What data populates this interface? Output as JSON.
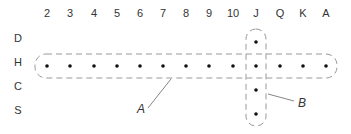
{
  "diagram": {
    "columns": [
      "2",
      "3",
      "4",
      "5",
      "6",
      "7",
      "8",
      "9",
      "10",
      "J",
      "Q",
      "K",
      "A"
    ],
    "rows": [
      "D",
      "H",
      "C",
      "S"
    ],
    "groups": [
      {
        "id": "A",
        "label": "A",
        "description": "Row H, all 13 columns"
      },
      {
        "id": "B",
        "label": "B",
        "description": "Column J, all 4 rows"
      }
    ],
    "dots": [
      {
        "row": "H",
        "cols": [
          "2",
          "3",
          "4",
          "5",
          "6",
          "7",
          "8",
          "9",
          "10",
          "J",
          "Q",
          "K",
          "A"
        ]
      },
      {
        "col": "J",
        "rows": [
          "D",
          "C",
          "S"
        ]
      }
    ],
    "colors": {
      "text": "#333333",
      "dash": "#999999",
      "dot": "#111111"
    }
  }
}
